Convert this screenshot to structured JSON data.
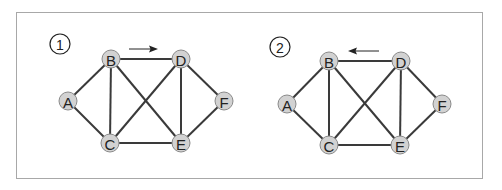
{
  "panels": [
    {
      "number": "1",
      "arrow_direction": "right",
      "nodes": [
        {
          "id": "A",
          "label": "A",
          "x": 68,
          "y": 101
        },
        {
          "id": "B",
          "label": "B",
          "x": 111,
          "y": 59
        },
        {
          "id": "C",
          "label": "C",
          "x": 110,
          "y": 143
        },
        {
          "id": "D",
          "label": "D",
          "x": 181,
          "y": 59
        },
        {
          "id": "E",
          "label": "E",
          "x": 181,
          "y": 143
        },
        {
          "id": "F",
          "label": "F",
          "x": 224,
          "y": 101
        }
      ]
    },
    {
      "number": "2",
      "arrow_direction": "left",
      "nodes": [
        {
          "id": "A",
          "label": "A",
          "x": 287,
          "y": 104
        },
        {
          "id": "B",
          "label": "B",
          "x": 329,
          "y": 61
        },
        {
          "id": "C",
          "label": "C",
          "x": 329,
          "y": 145
        },
        {
          "id": "D",
          "label": "D",
          "x": 401,
          "y": 61
        },
        {
          "id": "E",
          "label": "E",
          "x": 400,
          "y": 145
        },
        {
          "id": "F",
          "label": "F",
          "x": 442,
          "y": 104
        }
      ]
    }
  ],
  "edges": [
    [
      "A",
      "B"
    ],
    [
      "A",
      "C"
    ],
    [
      "B",
      "C"
    ],
    [
      "B",
      "D"
    ],
    [
      "B",
      "E"
    ],
    [
      "C",
      "D"
    ],
    [
      "C",
      "E"
    ],
    [
      "D",
      "E"
    ],
    [
      "D",
      "F"
    ],
    [
      "E",
      "F"
    ]
  ],
  "colors": {
    "node_fill": "#d2d2d2",
    "edge": "#3a3a3a",
    "frame": "#a8a8a8"
  }
}
